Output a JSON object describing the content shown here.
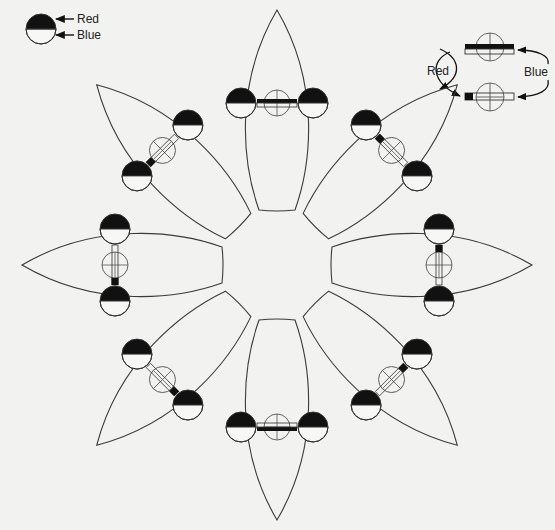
{
  "canvas": {
    "width": 555,
    "height": 530,
    "background": "#f2f2f0"
  },
  "colors": {
    "ink": "#111111",
    "line": "#3a3a3a",
    "paper": "#f7f7f5"
  },
  "legend_left": {
    "red_label": "Red",
    "blue_label": "Blue",
    "symbol": "half-filled-circle",
    "meaning": {
      "top_black_half": "Red",
      "bottom_white_half": "Blue"
    }
  },
  "legend_right": {
    "red_label": "Red",
    "blue_label": "Blue",
    "states": [
      "full-black-bar",
      "short-black-end-bar"
    ]
  },
  "flower": {
    "center": [
      277,
      265
    ],
    "petal_count": 8,
    "petals": [
      {
        "id": "top",
        "angle": -90,
        "indicator": "full-bar"
      },
      {
        "id": "top-right",
        "angle": -45,
        "indicator": "short-end"
      },
      {
        "id": "right",
        "angle": 0,
        "indicator": "short-end"
      },
      {
        "id": "bottom-right",
        "angle": 45,
        "indicator": "short-end"
      },
      {
        "id": "bottom",
        "angle": 90,
        "indicator": "full-bar"
      },
      {
        "id": "bottom-left",
        "angle": 135,
        "indicator": "short-end"
      },
      {
        "id": "left",
        "angle": 180,
        "indicator": "short-end"
      },
      {
        "id": "top-left",
        "angle": -135,
        "indicator": "short-end"
      }
    ]
  }
}
